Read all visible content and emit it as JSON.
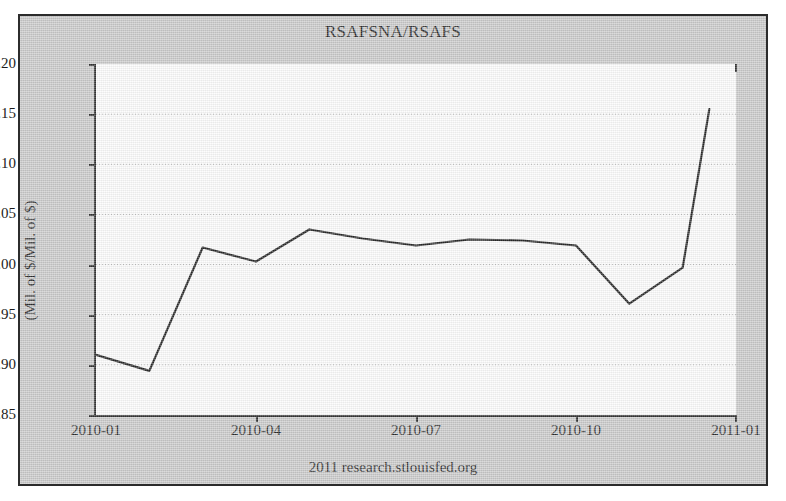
{
  "figure": {
    "title": "RSAFSNA/RSAFS",
    "ylabel": "(Mil. of $/Mil. of $)",
    "footer": "2011 research.stlouisfed.org",
    "frame_color": "#2c2c2c",
    "background_color": "#c9c9c9",
    "plot_background_color": "#fdfdfd",
    "line_color": "#1a1a1a",
    "grid_color": "#b9b9b9"
  },
  "chart_data": {
    "type": "line",
    "title": "RSAFSNA/RSAFS",
    "xlabel": "",
    "ylabel": "(Mil. of $/Mil. of $)",
    "ylim": [
      0.85,
      1.2
    ],
    "yticks": [
      "0.85",
      "0.90",
      "0.95",
      "1.00",
      "1.05",
      "1.10",
      "1.15",
      "1.20"
    ],
    "ytick_values": [
      0.85,
      0.9,
      0.95,
      1.0,
      1.05,
      1.1,
      1.15,
      1.2
    ],
    "xticks": [
      "2010-01",
      "2010-04",
      "2010-07",
      "2010-10",
      "2011-01"
    ],
    "xtick_values": [
      "2010-01",
      "2010-04",
      "2010-07",
      "2010-10",
      "2011-01"
    ],
    "xlim": [
      "2010-01",
      "2011-01"
    ],
    "grid": true,
    "legend": null,
    "series": [
      {
        "name": "RSAFSNA/RSAFS",
        "x": [
          "2010-01",
          "2010-02",
          "2010-03",
          "2010-04",
          "2010-05",
          "2010-06",
          "2010-07",
          "2010-08",
          "2010-09",
          "2010-10",
          "2010-11",
          "2010-12"
        ],
        "values": [
          0.91,
          0.894,
          1.017,
          1.003,
          1.035,
          1.026,
          1.019,
          1.025,
          1.024,
          1.019,
          0.961,
          0.997
        ]
      }
    ],
    "annotations": [
      {
        "text": "final point",
        "x": "2010-12",
        "y": 1.155
      }
    ],
    "last_point": {
      "x": "2010-12.5",
      "y": 1.155
    }
  }
}
